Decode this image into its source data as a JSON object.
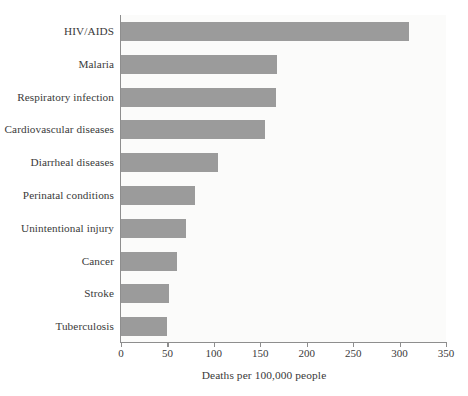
{
  "chart_data": {
    "type": "bar",
    "orientation": "horizontal",
    "title": "",
    "subtitle": "",
    "xlabel": "Deaths per 100,000 people",
    "ylabel": "",
    "categories": [
      "HIV/AIDS",
      "Malaria",
      "Respiratory infection",
      "Cardiovascular diseases",
      "Diarrheal diseases",
      "Perinatal conditions",
      "Unintentional injury",
      "Cancer",
      "Stroke",
      "Tuberculosis"
    ],
    "values": [
      310,
      168,
      167,
      155,
      104,
      80,
      70,
      60,
      52,
      50
    ],
    "xlim": [
      0,
      350
    ],
    "xticks": [
      0,
      50,
      100,
      150,
      200,
      250,
      300,
      350
    ],
    "xtick_labels": [
      "0",
      "50",
      "100",
      "150",
      "200",
      "250",
      "300",
      "350"
    ],
    "grid": false,
    "legend": null,
    "bar_color": "#9b9b9b",
    "axis_color": "#8e8e8e",
    "text_color": "#3a3a3a",
    "plot_background": "#fbfbfa",
    "figure_background": "#ffffff"
  }
}
